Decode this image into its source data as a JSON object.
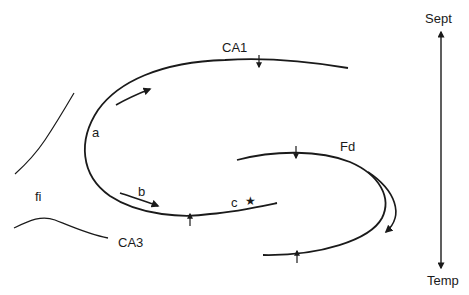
{
  "diagram": {
    "type": "hippocampus-schematic",
    "stroke_color": "#1a1a1a",
    "background": "#ffffff",
    "labels": {
      "ca1": "CA1",
      "ca3": "CA3",
      "fd": "Fd",
      "fi": "fi",
      "a": "a",
      "b": "b",
      "c": "c",
      "star": "★",
      "sept": "Sept",
      "temp": "Temp"
    },
    "axis": {
      "name": "septotemporal-axis",
      "top_label": "Sept",
      "bottom_label": "Temp"
    },
    "arrows": [
      {
        "id": "a",
        "description": "arrow along CA1 toward septal end"
      },
      {
        "id": "b",
        "description": "arrow along CA1 lower limb toward c"
      },
      {
        "id": "fd",
        "description": "curved arrow following Fd"
      }
    ],
    "markers": [
      {
        "id": "ca1-tick",
        "direction": "down"
      },
      {
        "id": "ca1-lower-tick",
        "direction": "up"
      },
      {
        "id": "fd-upper-tick",
        "direction": "down"
      },
      {
        "id": "fd-lower-tick",
        "direction": "up"
      }
    ]
  }
}
